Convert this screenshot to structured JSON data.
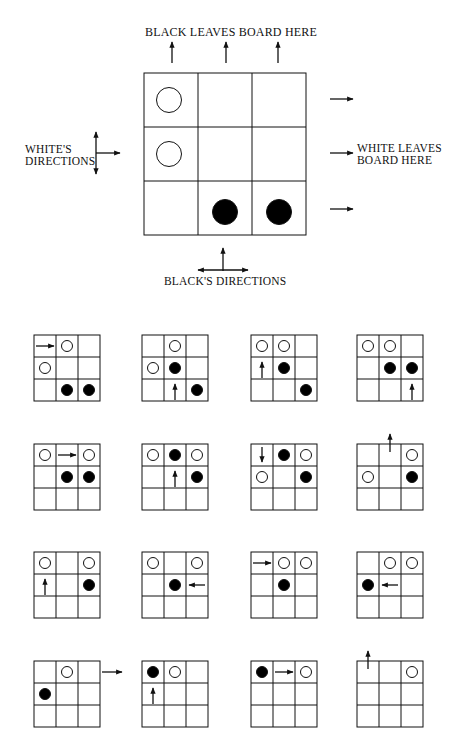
{
  "main_diagram": {
    "labels": {
      "top": "BLACK LEAVES BOARD HERE",
      "left_line1": "WHITE'S",
      "left_line2": "DIRECTIONS",
      "right_line1": "WHITE LEAVES",
      "right_line2": "BOARD HERE",
      "bottom": "BLACK'S DIRECTIONS"
    },
    "board": {
      "rows": 3,
      "cols": 3,
      "pieces": [
        {
          "row": 0,
          "col": 0,
          "color": "white"
        },
        {
          "row": 1,
          "col": 0,
          "color": "white"
        },
        {
          "row": 2,
          "col": 1,
          "color": "black"
        },
        {
          "row": 2,
          "col": 2,
          "color": "black"
        }
      ]
    },
    "white_directions": [
      "up",
      "right",
      "down"
    ],
    "black_directions": [
      "left",
      "up",
      "right"
    ]
  },
  "colors": {
    "line": "#111111",
    "black_piece": "#000000",
    "white_piece": "#ffffff",
    "background": "#ffffff"
  },
  "sequence": [
    {
      "pieces": [
        [
          0,
          1,
          "w"
        ],
        [
          1,
          0,
          "w"
        ],
        [
          2,
          1,
          "b"
        ],
        [
          2,
          2,
          "b"
        ]
      ],
      "arrow": {
        "row": 0,
        "col": 0,
        "dir": "right"
      }
    },
    {
      "pieces": [
        [
          0,
          1,
          "w"
        ],
        [
          1,
          0,
          "w"
        ],
        [
          1,
          1,
          "b"
        ],
        [
          2,
          2,
          "b"
        ]
      ],
      "arrow": {
        "row": 2,
        "col": 1,
        "dir": "up"
      }
    },
    {
      "pieces": [
        [
          0,
          0,
          "w"
        ],
        [
          0,
          1,
          "w"
        ],
        [
          1,
          1,
          "b"
        ],
        [
          2,
          2,
          "b"
        ]
      ],
      "arrow": {
        "row": 1,
        "col": 0,
        "dir": "up"
      }
    },
    {
      "pieces": [
        [
          0,
          0,
          "w"
        ],
        [
          0,
          1,
          "w"
        ],
        [
          1,
          1,
          "b"
        ],
        [
          1,
          2,
          "b"
        ]
      ],
      "arrow": {
        "row": 2,
        "col": 2,
        "dir": "up"
      }
    },
    {
      "pieces": [
        [
          0,
          0,
          "w"
        ],
        [
          0,
          2,
          "w"
        ],
        [
          1,
          1,
          "b"
        ],
        [
          1,
          2,
          "b"
        ]
      ],
      "arrow": {
        "row": 0,
        "col": 1,
        "dir": "right"
      }
    },
    {
      "pieces": [
        [
          0,
          0,
          "w"
        ],
        [
          0,
          1,
          "b"
        ],
        [
          0,
          2,
          "w"
        ],
        [
          1,
          2,
          "b"
        ]
      ],
      "arrow": {
        "row": 1,
        "col": 1,
        "dir": "up"
      }
    },
    {
      "pieces": [
        [
          0,
          1,
          "b"
        ],
        [
          0,
          2,
          "w"
        ],
        [
          1,
          0,
          "w"
        ],
        [
          1,
          2,
          "b"
        ]
      ],
      "arrow": {
        "row": 0,
        "col": 0,
        "dir": "down"
      }
    },
    {
      "pieces": [
        [
          0,
          2,
          "w"
        ],
        [
          1,
          0,
          "w"
        ],
        [
          1,
          2,
          "b"
        ]
      ],
      "arrow": {
        "row": -1,
        "col": 1,
        "dir": "up-out"
      }
    },
    {
      "pieces": [
        [
          0,
          0,
          "w"
        ],
        [
          0,
          2,
          "w"
        ],
        [
          1,
          2,
          "b"
        ]
      ],
      "arrow": {
        "row": 1,
        "col": 0,
        "dir": "up"
      }
    },
    {
      "pieces": [
        [
          0,
          0,
          "w"
        ],
        [
          0,
          2,
          "w"
        ],
        [
          1,
          1,
          "b"
        ]
      ],
      "arrow": {
        "row": 1,
        "col": 2,
        "dir": "left"
      }
    },
    {
      "pieces": [
        [
          0,
          1,
          "w"
        ],
        [
          0,
          2,
          "w"
        ],
        [
          1,
          1,
          "b"
        ]
      ],
      "arrow": {
        "row": 0,
        "col": 0,
        "dir": "right"
      }
    },
    {
      "pieces": [
        [
          0,
          1,
          "w"
        ],
        [
          0,
          2,
          "w"
        ],
        [
          1,
          0,
          "b"
        ]
      ],
      "arrow": {
        "row": 1,
        "col": 1,
        "dir": "left"
      }
    },
    {
      "pieces": [
        [
          0,
          1,
          "w"
        ],
        [
          1,
          0,
          "b"
        ]
      ],
      "arrow": {
        "row": 0,
        "col": 3,
        "dir": "right-out"
      }
    },
    {
      "pieces": [
        [
          0,
          0,
          "b"
        ],
        [
          0,
          1,
          "w"
        ]
      ],
      "arrow": {
        "row": 1,
        "col": 0,
        "dir": "up"
      }
    },
    {
      "pieces": [
        [
          0,
          0,
          "b"
        ],
        [
          0,
          2,
          "w"
        ]
      ],
      "arrow": {
        "row": 0,
        "col": 1,
        "dir": "right"
      }
    },
    {
      "pieces": [
        [
          0,
          2,
          "w"
        ]
      ],
      "arrow": {
        "row": -1,
        "col": 0,
        "dir": "up-out"
      }
    }
  ]
}
